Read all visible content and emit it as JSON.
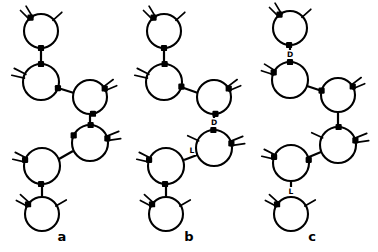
{
  "figure": {
    "background_color": "#ffffff",
    "ink_color": "#000000",
    "width": 378,
    "height": 252
  },
  "panels": [
    {
      "id": "a",
      "label": "a",
      "label_x": 62,
      "label_y": 241,
      "rings": [
        {
          "id": "a1",
          "cx": 41,
          "cy": 31,
          "r": 17,
          "nodes": [
            {
              "angle": 232,
              "type": "square"
            },
            {
              "angle": 90,
              "type": "square"
            }
          ],
          "stubs": [
            {
              "angle": 232,
              "spread": 14,
              "count": 2,
              "len": 12
            },
            {
              "angle": 318,
              "spread": 0,
              "count": 1,
              "len": 11
            }
          ],
          "arc": null
        },
        {
          "id": "a2",
          "cx": 41,
          "cy": 82,
          "r": 18,
          "nodes": [
            {
              "angle": 270,
              "type": "square"
            },
            {
              "angle": 20,
              "type": "square"
            }
          ],
          "stubs": [
            {
              "angle": 200,
              "spread": 14,
              "count": 2,
              "len": 12
            }
          ],
          "arc": null
        },
        {
          "id": "a3",
          "cx": 90,
          "cy": 97,
          "r": 17,
          "nodes": [
            {
              "angle": 195,
              "type": "none"
            },
            {
              "angle": 330,
              "type": "square"
            },
            {
              "angle": 80,
              "type": "square"
            }
          ],
          "stubs": [
            {
              "angle": 330,
              "spread": 14,
              "count": 2,
              "len": 12
            }
          ],
          "arc": null
        },
        {
          "id": "a4",
          "cx": 90,
          "cy": 143,
          "r": 18,
          "nodes": [
            {
              "angle": 272,
              "type": "square"
            },
            {
              "angle": 205,
              "type": "square"
            },
            {
              "angle": 345,
              "type": "square"
            }
          ],
          "stubs": [
            {
              "angle": 345,
              "spread": 14,
              "count": 2,
              "len": 13
            }
          ],
          "arc": {
            "side": "left",
            "start": 280,
            "end": 150,
            "bulge": 13
          }
        },
        {
          "id": "a5",
          "cx": 42,
          "cy": 166,
          "r": 18,
          "nodes": [
            {
              "angle": 200,
              "type": "square"
            },
            {
              "angle": 93,
              "type": "square"
            }
          ],
          "stubs": [
            {
              "angle": 200,
              "spread": 14,
              "count": 2,
              "len": 12
            }
          ],
          "arc": null
        },
        {
          "id": "a6",
          "cx": 42,
          "cy": 214,
          "r": 17,
          "nodes": [
            {
              "angle": 215,
              "type": "square"
            }
          ],
          "stubs": [
            {
              "angle": 215,
              "spread": 14,
              "count": 2,
              "len": 12
            },
            {
              "angle": 330,
              "spread": 0,
              "count": 1,
              "len": 11
            }
          ],
          "arc": null
        }
      ],
      "bonds": [
        {
          "from": "a1",
          "to": "a2",
          "x1": 41,
          "y1": 48,
          "x2": 41,
          "y2": 64,
          "label": null
        },
        {
          "from": "a2",
          "to": "a3",
          "x1": 58,
          "y1": 88,
          "x2": 74,
          "y2": 93,
          "label": null
        },
        {
          "from": "a3",
          "to": "a4",
          "x1": 90,
          "y1": 114,
          "x2": 90,
          "y2": 125,
          "label": null
        },
        {
          "from": "a4",
          "to": "a5",
          "x1": 73,
          "y1": 151,
          "x2": 59,
          "y2": 159,
          "label": null
        },
        {
          "from": "a5",
          "to": "a6",
          "x1": 42,
          "y1": 184,
          "x2": 42,
          "y2": 197,
          "label": null
        }
      ]
    },
    {
      "id": "b",
      "label": "b",
      "label_x": 189,
      "label_y": 241,
      "rings": [
        {
          "id": "b1",
          "cx": 164,
          "cy": 31,
          "r": 17,
          "nodes": [
            {
              "angle": 232,
              "type": "square"
            },
            {
              "angle": 90,
              "type": "square"
            }
          ],
          "stubs": [
            {
              "angle": 232,
              "spread": 14,
              "count": 2,
              "len": 12
            },
            {
              "angle": 318,
              "spread": 0,
              "count": 1,
              "len": 11
            }
          ],
          "arc": null
        },
        {
          "id": "b2",
          "cx": 164,
          "cy": 82,
          "r": 18,
          "nodes": [
            {
              "angle": 272,
              "type": "square"
            },
            {
              "angle": 15,
              "type": "square"
            }
          ],
          "stubs": [
            {
              "angle": 200,
              "spread": 14,
              "count": 2,
              "len": 12
            }
          ],
          "arc": {
            "side": "right",
            "start": 280,
            "end": 25,
            "bulge": 13
          }
        },
        {
          "id": "b3",
          "cx": 214,
          "cy": 97,
          "r": 17,
          "nodes": [
            {
              "angle": 330,
              "type": "square"
            },
            {
              "angle": 85,
              "type": "square"
            }
          ],
          "stubs": [
            {
              "angle": 330,
              "spread": 14,
              "count": 2,
              "len": 12
            }
          ],
          "arc": {
            "side": "left",
            "start": 265,
            "end": 160,
            "bulge": 13
          }
        },
        {
          "id": "b4",
          "cx": 214,
          "cy": 148,
          "r": 18,
          "nodes": [
            {
              "angle": 268,
              "type": "square"
            },
            {
              "angle": 345,
              "type": "square"
            }
          ],
          "stubs": [
            {
              "angle": 345,
              "spread": 14,
              "count": 2,
              "len": 13
            },
            {
              "angle": 205,
              "spread": 0,
              "count": 1,
              "len": 11
            }
          ],
          "arc": null
        },
        {
          "id": "b5",
          "cx": 166,
          "cy": 166,
          "r": 18,
          "nodes": [
            {
              "angle": 200,
              "type": "square"
            },
            {
              "angle": 93,
              "type": "square"
            }
          ],
          "stubs": [
            {
              "angle": 200,
              "spread": 14,
              "count": 2,
              "len": 12
            }
          ],
          "arc": {
            "side": "right",
            "start": 355,
            "end": 85,
            "bulge": 13
          }
        },
        {
          "id": "b6",
          "cx": 166,
          "cy": 214,
          "r": 17,
          "nodes": [
            {
              "angle": 215,
              "type": "square"
            }
          ],
          "stubs": [
            {
              "angle": 215,
              "spread": 14,
              "count": 2,
              "len": 12
            },
            {
              "angle": 330,
              "spread": 0,
              "count": 1,
              "len": 11
            }
          ],
          "arc": null
        }
      ],
      "bonds": [
        {
          "from": "b1",
          "to": "b2",
          "x1": 164,
          "y1": 48,
          "x2": 164,
          "y2": 64,
          "label": null
        },
        {
          "from": "b2",
          "to": "b3",
          "x1": 181,
          "y1": 87,
          "x2": 198,
          "y2": 93,
          "label": null
        },
        {
          "from": "b3",
          "to": "b4",
          "x1": 214,
          "y1": 114,
          "x2": 214,
          "y2": 130,
          "label": "D",
          "label_x": 214,
          "label_y": 125
        },
        {
          "from": "b4",
          "to": "b5",
          "x1": 197,
          "y1": 155,
          "x2": 184,
          "y2": 160,
          "label": "L",
          "label_x": 192,
          "label_y": 153
        },
        {
          "from": "b5",
          "to": "b6",
          "x1": 166,
          "y1": 184,
          "x2": 166,
          "y2": 197,
          "label": null
        }
      ]
    },
    {
      "id": "c",
      "label": "c",
      "label_x": 312,
      "label_y": 241,
      "rings": [
        {
          "id": "c1",
          "cx": 290,
          "cy": 28,
          "r": 17,
          "nodes": [
            {
              "angle": 232,
              "type": "square"
            },
            {
              "angle": 93,
              "type": "square"
            }
          ],
          "stubs": [
            {
              "angle": 232,
              "spread": 14,
              "count": 2,
              "len": 12
            },
            {
              "angle": 318,
              "spread": 0,
              "count": 1,
              "len": 11
            }
          ],
          "arc": null
        },
        {
          "id": "c2",
          "cx": 290,
          "cy": 80,
          "r": 18,
          "nodes": [
            {
              "angle": 270,
              "type": "square"
            },
            {
              "angle": 205,
              "type": "square"
            }
          ],
          "stubs": [
            {
              "angle": 205,
              "spread": 14,
              "count": 2,
              "len": 12
            }
          ],
          "arc": null
        },
        {
          "id": "c3",
          "cx": 338,
          "cy": 95,
          "r": 17,
          "nodes": [
            {
              "angle": 195,
              "type": "square"
            },
            {
              "angle": 330,
              "type": "square"
            },
            {
              "angle": 82,
              "type": "none"
            }
          ],
          "stubs": [
            {
              "angle": 330,
              "spread": 14,
              "count": 2,
              "len": 12
            }
          ],
          "arc": null
        },
        {
          "id": "c4",
          "cx": 338,
          "cy": 145,
          "r": 18,
          "nodes": [
            {
              "angle": 272,
              "type": "square"
            },
            {
              "angle": 345,
              "type": "square"
            }
          ],
          "stubs": [
            {
              "angle": 345,
              "spread": 14,
              "count": 2,
              "len": 13
            },
            {
              "angle": 205,
              "spread": 0,
              "count": 1,
              "len": 11
            }
          ],
          "arc": null
        },
        {
          "id": "c5",
          "cx": 291,
          "cy": 163,
          "r": 18,
          "nodes": [
            {
              "angle": 200,
              "type": "square"
            },
            {
              "angle": 350,
              "type": "square"
            },
            {
              "angle": 90,
              "type": "none"
            }
          ],
          "stubs": [
            {
              "angle": 200,
              "spread": 14,
              "count": 2,
              "len": 12
            }
          ],
          "arc": null
        },
        {
          "id": "c6",
          "cx": 291,
          "cy": 214,
          "r": 17,
          "nodes": [
            {
              "angle": 215,
              "type": "square"
            }
          ],
          "stubs": [
            {
              "angle": 215,
              "spread": 14,
              "count": 2,
              "len": 12
            },
            {
              "angle": 330,
              "spread": 0,
              "count": 1,
              "len": 11
            }
          ],
          "arc": null
        }
      ],
      "bonds": [
        {
          "from": "c1",
          "to": "c2",
          "x1": 290,
          "y1": 45,
          "x2": 290,
          "y2": 62,
          "label": "D",
          "label_x": 290,
          "label_y": 57
        },
        {
          "from": "c2",
          "to": "c3",
          "x1": 307,
          "y1": 86,
          "x2": 322,
          "y2": 91,
          "label": null
        },
        {
          "from": "c3",
          "to": "c4",
          "x1": 338,
          "y1": 112,
          "x2": 338,
          "y2": 127,
          "label": null
        },
        {
          "from": "c4",
          "to": "c5",
          "x1": 321,
          "y1": 152,
          "x2": 309,
          "y2": 157,
          "label": null
        },
        {
          "from": "c5",
          "to": "c6",
          "x1": 291,
          "y1": 181,
          "x2": 291,
          "y2": 197,
          "label": "L",
          "label_x": 291,
          "label_y": 194
        }
      ]
    }
  ]
}
